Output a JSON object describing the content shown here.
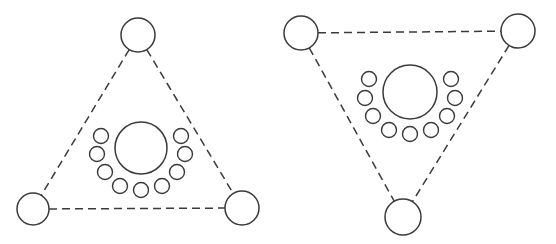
{
  "figure": {
    "title": "",
    "width": 556,
    "height": 244,
    "background_color": "#ffffff",
    "stroke_color": "#3a3a3a",
    "fill_color": "#ffffff",
    "panel_count": 2
  },
  "style": {
    "edge_stroke_width": 1.5,
    "edge_dash_pattern": "8 5",
    "node_stroke_width": 1.5,
    "hub_stroke_width": 1.5,
    "satellite_stroke_width": 1.4
  },
  "panels": [
    {
      "id": "panel-left",
      "name": "left-diagram",
      "orientation": "apex-up",
      "hub": {
        "cx": 141,
        "cy": 148,
        "r": 26
      },
      "vertices": [
        {
          "id": "left-vertex-top",
          "label": "",
          "cx": 138,
          "cy": 35,
          "r": 17
        },
        {
          "id": "left-vertex-bottom-left",
          "label": "",
          "cx": 33,
          "cy": 209,
          "r": 16
        },
        {
          "id": "left-vertex-bottom-right",
          "label": "",
          "cx": 242,
          "cy": 208,
          "r": 17
        }
      ],
      "edges": [
        {
          "id": "left-edge-top-to-bottom-left",
          "from": 0,
          "to": 1
        },
        {
          "id": "left-edge-top-to-bottom-right",
          "from": 0,
          "to": 2
        },
        {
          "id": "left-edge-bottom-left-to-bottom-right",
          "from": 1,
          "to": 2
        }
      ],
      "satellites": [
        {
          "cx": 101,
          "cy": 136,
          "r": 7.5
        },
        {
          "cx": 97,
          "cy": 154,
          "r": 7.5
        },
        {
          "cx": 105,
          "cy": 172,
          "r": 7.5
        },
        {
          "cx": 120,
          "cy": 186,
          "r": 7.5
        },
        {
          "cx": 141,
          "cy": 190,
          "r": 7.5
        },
        {
          "cx": 162,
          "cy": 186,
          "r": 7.5
        },
        {
          "cx": 177,
          "cy": 172,
          "r": 7.5
        },
        {
          "cx": 185,
          "cy": 154,
          "r": 7.5
        },
        {
          "cx": 181,
          "cy": 136,
          "r": 7.5
        }
      ]
    },
    {
      "id": "panel-right",
      "name": "right-diagram",
      "orientation": "apex-down",
      "hub": {
        "cx": 410,
        "cy": 92,
        "r": 27
      },
      "vertices": [
        {
          "id": "right-vertex-top-left",
          "label": "",
          "cx": 301,
          "cy": 33,
          "r": 17
        },
        {
          "id": "right-vertex-top-right",
          "label": "",
          "cx": 518,
          "cy": 31,
          "r": 17
        },
        {
          "id": "right-vertex-bottom",
          "label": "",
          "cx": 403,
          "cy": 217,
          "r": 18
        }
      ],
      "edges": [
        {
          "id": "right-edge-top-left-to-top-right",
          "from": 0,
          "to": 1
        },
        {
          "id": "right-edge-top-left-to-bottom",
          "from": 0,
          "to": 2
        },
        {
          "id": "right-edge-top-right-to-bottom",
          "from": 1,
          "to": 2
        }
      ],
      "satellites": [
        {
          "cx": 369,
          "cy": 79,
          "r": 7.5
        },
        {
          "cx": 365,
          "cy": 98,
          "r": 7.5
        },
        {
          "cx": 373,
          "cy": 116,
          "r": 7.5
        },
        {
          "cx": 389,
          "cy": 130,
          "r": 7.5
        },
        {
          "cx": 410,
          "cy": 134,
          "r": 7.5
        },
        {
          "cx": 431,
          "cy": 130,
          "r": 7.5
        },
        {
          "cx": 447,
          "cy": 116,
          "r": 7.5
        },
        {
          "cx": 455,
          "cy": 98,
          "r": 7.5
        },
        {
          "cx": 451,
          "cy": 79,
          "r": 7.5
        }
      ]
    }
  ]
}
